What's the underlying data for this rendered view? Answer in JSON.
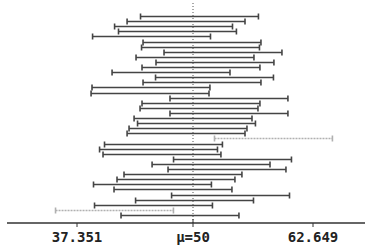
{
  "chart_data": {
    "type": "interval",
    "title": "",
    "xlabel": "",
    "ylabel": "",
    "xlim": [
      29.25,
      65.69
    ],
    "grid": false,
    "legend": null,
    "reference_line": {
      "value": 50,
      "label": "μ=50",
      "style": "dotted"
    },
    "tick_labels": [
      "37.351",
      "μ=50",
      "62.649"
    ],
    "tick_values": [
      37.351,
      50,
      62.649
    ],
    "half_width": 6.32,
    "colors": {
      "covers": "#444444",
      "misses": "#b0b0b0",
      "axis": "#333333",
      "reference": "#555555"
    },
    "intervals": [
      {
        "center": 50.48,
        "covers": true
      },
      {
        "center": 49.04,
        "covers": true
      },
      {
        "center": 47.7,
        "covers": true
      },
      {
        "center": 48.12,
        "covers": true
      },
      {
        "center": 45.34,
        "covers": true
      },
      {
        "center": 50.75,
        "covers": true
      },
      {
        "center": 50.59,
        "covers": true
      },
      {
        "center": 53.0,
        "covers": true
      },
      {
        "center": 50.0,
        "covers": true
      },
      {
        "center": 52.14,
        "covers": true
      },
      {
        "center": 50.64,
        "covers": true
      },
      {
        "center": 47.43,
        "covers": true
      },
      {
        "center": 52.09,
        "covers": true
      },
      {
        "center": 50.75,
        "covers": true
      },
      {
        "center": 45.28,
        "covers": true
      },
      {
        "center": 45.18,
        "covers": true
      },
      {
        "center": 53.64,
        "covers": true
      },
      {
        "center": 50.64,
        "covers": true
      },
      {
        "center": 50.43,
        "covers": true
      },
      {
        "center": 53.64,
        "covers": true
      },
      {
        "center": 49.79,
        "covers": true
      },
      {
        "center": 50.16,
        "covers": true
      },
      {
        "center": 49.25,
        "covers": true
      },
      {
        "center": 49.04,
        "covers": true
      },
      {
        "center": 58.41,
        "covers": false
      },
      {
        "center": 46.62,
        "covers": true
      },
      {
        "center": 46.09,
        "covers": true
      },
      {
        "center": 46.46,
        "covers": true
      },
      {
        "center": 54.02,
        "covers": true
      },
      {
        "center": 51.72,
        "covers": true
      },
      {
        "center": 53.43,
        "covers": true
      },
      {
        "center": 48.71,
        "covers": true
      },
      {
        "center": 47.96,
        "covers": true
      },
      {
        "center": 45.44,
        "covers": true
      },
      {
        "center": 47.64,
        "covers": true
      },
      {
        "center": 53.81,
        "covers": true
      },
      {
        "center": 49.95,
        "covers": true
      },
      {
        "center": 45.55,
        "covers": true
      },
      {
        "center": 41.37,
        "covers": false
      },
      {
        "center": 48.39,
        "covers": true
      }
    ]
  },
  "axis": {
    "labels": {
      "left": "37.351",
      "center": "μ=50",
      "right": "62.649"
    }
  }
}
